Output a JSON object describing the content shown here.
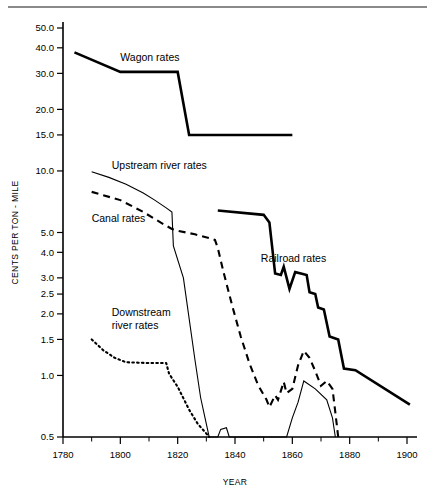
{
  "figure": {
    "background": "#ffffff",
    "rule_color": "#8a8a8a",
    "ink_color": "#000000"
  },
  "axis_titles": {
    "y": "CENTS PER TON - MILE",
    "x": "YEAR"
  },
  "chart_data": {
    "type": "line",
    "title": "",
    "subtitle": "",
    "xlabel": "YEAR",
    "ylabel": "CENTS PER TON - MILE",
    "xlim": [
      1780,
      1902
    ],
    "ylim": [
      0.5,
      50
    ],
    "yscale": "log",
    "xscale": "linear",
    "grid": false,
    "legend": "inline-annotations",
    "ytick_values": [
      50.0,
      40.0,
      30.0,
      20.0,
      15.0,
      10.0,
      5.0,
      4.0,
      3.0,
      2.5,
      2.0,
      1.5,
      1.0,
      0.5
    ],
    "ytick_labels": [
      "50.0",
      "40.0",
      "30.0",
      "20.0",
      "15.0",
      "10.0",
      "5.0",
      "4.0",
      "3.0",
      "2.5",
      "2.0",
      "1.5",
      "1.0",
      "0.5"
    ],
    "xtick_values": [
      1780,
      1800,
      1820,
      1840,
      1860,
      1880,
      1900
    ],
    "xtick_labels": [
      "1780",
      "1800",
      "1820",
      "1840",
      "1860",
      "1880",
      "1900"
    ],
    "xtick_minor": [
      1790,
      1810,
      1830,
      1850,
      1870,
      1890
    ],
    "series": [
      {
        "name": "Wagon rates",
        "style": "solid-thick",
        "label": "Wagon rates",
        "label_xy": [
          1800,
          34.5
        ],
        "points": [
          [
            1784,
            38.0
          ],
          [
            1800,
            30.5
          ],
          [
            1820,
            30.5
          ],
          [
            1824,
            15.0
          ],
          [
            1860,
            15.0
          ]
        ]
      },
      {
        "name": "Upstream river rates",
        "style": "solid-thin",
        "label": "Upstream river rates",
        "label_xy": [
          1797,
          10.2
        ],
        "points": [
          [
            1790,
            9.9
          ],
          [
            1796,
            9.3
          ],
          [
            1802,
            8.6
          ],
          [
            1808,
            7.8
          ],
          [
            1812,
            7.2
          ],
          [
            1816,
            6.6
          ],
          [
            1818,
            6.3
          ],
          [
            1818.5,
            4.3
          ],
          [
            1822,
            3.0
          ],
          [
            1826,
            1.2
          ],
          [
            1828,
            0.78
          ],
          [
            1830,
            0.58
          ],
          [
            1831,
            0.5
          ],
          [
            1834,
            0.5
          ],
          [
            1835,
            0.545
          ],
          [
            1837,
            0.555
          ],
          [
            1838,
            0.5
          ],
          [
            1858,
            0.5
          ],
          [
            1860,
            0.62
          ],
          [
            1862,
            0.74
          ],
          [
            1864,
            0.94
          ],
          [
            1868,
            0.86
          ],
          [
            1872,
            0.76
          ],
          [
            1874,
            0.62
          ],
          [
            1875,
            0.5
          ]
        ]
      },
      {
        "name": "Canal rates",
        "style": "dashed",
        "label": "Canal rates",
        "label_xy": [
          1790,
          5.6
        ],
        "points": [
          [
            1790,
            7.9
          ],
          [
            1800,
            7.2
          ],
          [
            1808,
            6.3
          ],
          [
            1814,
            5.6
          ],
          [
            1818,
            5.2
          ],
          [
            1820,
            5.1
          ],
          [
            1826,
            4.9
          ],
          [
            1831,
            4.7
          ],
          [
            1833,
            4.6
          ],
          [
            1834,
            4.2
          ],
          [
            1836,
            3.2
          ],
          [
            1839,
            2.2
          ],
          [
            1842,
            1.55
          ],
          [
            1845,
            1.15
          ],
          [
            1848,
            0.9
          ],
          [
            1851,
            0.76
          ],
          [
            1852,
            0.7
          ],
          [
            1854,
            0.8
          ],
          [
            1855,
            0.76
          ],
          [
            1857,
            0.93
          ],
          [
            1858,
            0.82
          ],
          [
            1860,
            0.86
          ],
          [
            1862,
            1.12
          ],
          [
            1864,
            1.32
          ],
          [
            1866,
            1.22
          ],
          [
            1868,
            1.05
          ],
          [
            1870,
            0.89
          ],
          [
            1872,
            0.94
          ],
          [
            1874,
            0.86
          ],
          [
            1875,
            0.66
          ],
          [
            1876,
            0.5
          ]
        ]
      },
      {
        "name": "Downstream river rates",
        "style": "dotted",
        "label": "Downstream river rates",
        "label_xy": [
          1797,
          1.95
        ],
        "label_lines": [
          "Downstream",
          "river rates"
        ],
        "points": [
          [
            1790,
            1.5
          ],
          [
            1794,
            1.33
          ],
          [
            1798,
            1.22
          ],
          [
            1802,
            1.16
          ],
          [
            1810,
            1.15
          ],
          [
            1816,
            1.15
          ],
          [
            1817,
            1.02
          ],
          [
            1820,
            0.88
          ],
          [
            1824,
            0.68
          ],
          [
            1827,
            0.58
          ],
          [
            1830,
            0.52
          ],
          [
            1831,
            0.5
          ]
        ]
      },
      {
        "name": "Railroad rates",
        "style": "solid-thick",
        "label": "Railroad rates",
        "label_xy": [
          1849,
          3.6
        ],
        "points": [
          [
            1834,
            6.4
          ],
          [
            1850,
            6.1
          ],
          [
            1852,
            5.6
          ],
          [
            1854,
            3.15
          ],
          [
            1856,
            3.1
          ],
          [
            1857,
            3.4
          ],
          [
            1859,
            2.65
          ],
          [
            1861,
            3.2
          ],
          [
            1863,
            3.15
          ],
          [
            1865,
            3.1
          ],
          [
            1866,
            2.55
          ],
          [
            1868,
            2.5
          ],
          [
            1869,
            2.15
          ],
          [
            1871,
            2.1
          ],
          [
            1873,
            1.55
          ],
          [
            1876,
            1.5
          ],
          [
            1878,
            1.08
          ],
          [
            1882,
            1.06
          ],
          [
            1901,
            0.72
          ]
        ]
      }
    ]
  }
}
